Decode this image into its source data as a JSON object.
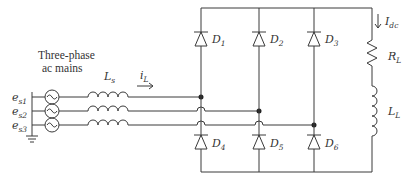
{
  "diagram": {
    "type": "three-phase diode bridge rectifier",
    "source_label_line1": "Three-phase",
    "source_label_line2": "ac mains",
    "sources": [
      {
        "name": "e",
        "sub": "s1"
      },
      {
        "name": "e",
        "sub": "s2"
      },
      {
        "name": "e",
        "sub": "s3"
      }
    ],
    "line_inductor": {
      "name": "L",
      "sub": "s"
    },
    "line_current": {
      "name": "i",
      "sub": "L"
    },
    "diodes": [
      {
        "name": "D",
        "sub": "1"
      },
      {
        "name": "D",
        "sub": "2"
      },
      {
        "name": "D",
        "sub": "3"
      },
      {
        "name": "D",
        "sub": "4"
      },
      {
        "name": "D",
        "sub": "5"
      },
      {
        "name": "D",
        "sub": "6"
      }
    ],
    "dc_current": {
      "name": "I",
      "sub": "dc"
    },
    "load_resistor": {
      "name": "R",
      "sub": "L"
    },
    "load_inductor": {
      "name": "L",
      "sub": "L"
    },
    "colors": {
      "wire": "#3a3a3a",
      "text": "#333333",
      "background": "#ffffff"
    }
  }
}
